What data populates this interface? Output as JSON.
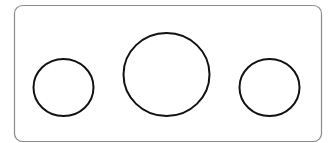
{
  "diagram": {
    "frame": {
      "x": 14.5,
      "y": 5.5,
      "width": 307,
      "height": 136,
      "radius": 8,
      "stroke": "#8a8a8a",
      "stroke_width": 1.2
    },
    "shapes": [
      {
        "name": "left-circle",
        "cx": 63.5,
        "cy": 87.5,
        "rx": 30,
        "ry": 28.5,
        "stroke": "#111111",
        "stroke_width": 2
      },
      {
        "name": "center-circle",
        "cx": 166.5,
        "cy": 74.5,
        "rx": 43,
        "ry": 41.5,
        "stroke": "#111111",
        "stroke_width": 2
      },
      {
        "name": "right-circle",
        "cx": 269.5,
        "cy": 87.5,
        "rx": 30,
        "ry": 28.5,
        "stroke": "#111111",
        "stroke_width": 2
      }
    ]
  }
}
